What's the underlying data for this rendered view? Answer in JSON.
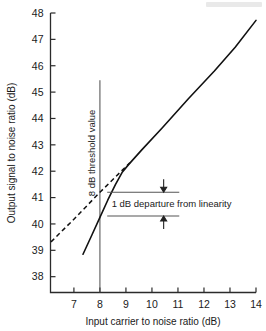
{
  "figure": {
    "kind": "scanned-technical-figure"
  },
  "chart_data": {
    "type": "line",
    "title": "",
    "subtitle": "",
    "xlabel": "Input carrier to noise ratio (dB)",
    "ylabel": "Output signal to noise ratio (dB)",
    "xlim": [
      6.1,
      14.0
    ],
    "ylim": [
      37.4,
      48.0
    ],
    "xticks": [
      7,
      8,
      9,
      10,
      11,
      12,
      13,
      14
    ],
    "xtick_labels": [
      "7",
      "8",
      "9",
      "10",
      "11",
      "12",
      "13",
      "14"
    ],
    "yticks": [
      38,
      39,
      40,
      41,
      42,
      43,
      44,
      45,
      46,
      47,
      48
    ],
    "ytick_labels": [
      "38",
      "39",
      "40",
      "41",
      "42",
      "43",
      "44",
      "45",
      "46",
      "47",
      "48"
    ],
    "grid": false,
    "legend": null,
    "legend_position": "none",
    "series": [
      {
        "name": "Measured output S/N characteristic",
        "style": "solid",
        "points": [
          [
            7.35,
            38.85
          ],
          [
            7.7,
            39.6
          ],
          [
            8.0,
            40.25
          ],
          [
            8.3,
            40.9
          ],
          [
            8.6,
            41.5
          ],
          [
            8.85,
            41.95
          ],
          [
            9.1,
            42.25
          ],
          [
            9.6,
            42.8
          ],
          [
            10.4,
            43.65
          ],
          [
            11.4,
            44.75
          ],
          [
            12.4,
            45.8
          ],
          [
            13.2,
            46.7
          ],
          [
            14.0,
            47.72
          ]
        ]
      },
      {
        "name": "Ideal linear extrapolation",
        "style": "dashed",
        "points": [
          [
            6.12,
            39.32
          ],
          [
            7.0,
            40.18
          ],
          [
            8.0,
            41.2
          ],
          [
            9.15,
            42.32
          ]
        ]
      }
    ],
    "annotations": [
      {
        "name": "threshold-line",
        "type": "vertical-line",
        "x": 8.0,
        "y_from": 37.4,
        "y_to": 45.45,
        "label": "8 dB threshold value",
        "label_orientation": "vertical"
      },
      {
        "name": "departure-upper-line",
        "type": "horizontal-line",
        "y": 41.2,
        "x_from": 8.28,
        "x_to": 11.05,
        "arrow": "down"
      },
      {
        "name": "departure-lower-line",
        "type": "horizontal-line",
        "y": 40.3,
        "x_from": 8.28,
        "x_to": 11.05,
        "arrow": "up"
      },
      {
        "name": "departure-label",
        "type": "text",
        "text": "1 dB departure from linearity",
        "x": 8.45,
        "y": 40.78
      }
    ]
  },
  "labels": {
    "x_axis_title": "Input carrier to noise ratio (dB)",
    "y_axis_title": "Output signal to noise ratio (dB)",
    "threshold_note": "8 dB threshold value",
    "departure_note": "1 dB departure from linearity"
  },
  "colors": {
    "ink": "#111111",
    "axis": "#2b2b2b",
    "annotation_rule": "#555555",
    "background": "#ffffff"
  }
}
